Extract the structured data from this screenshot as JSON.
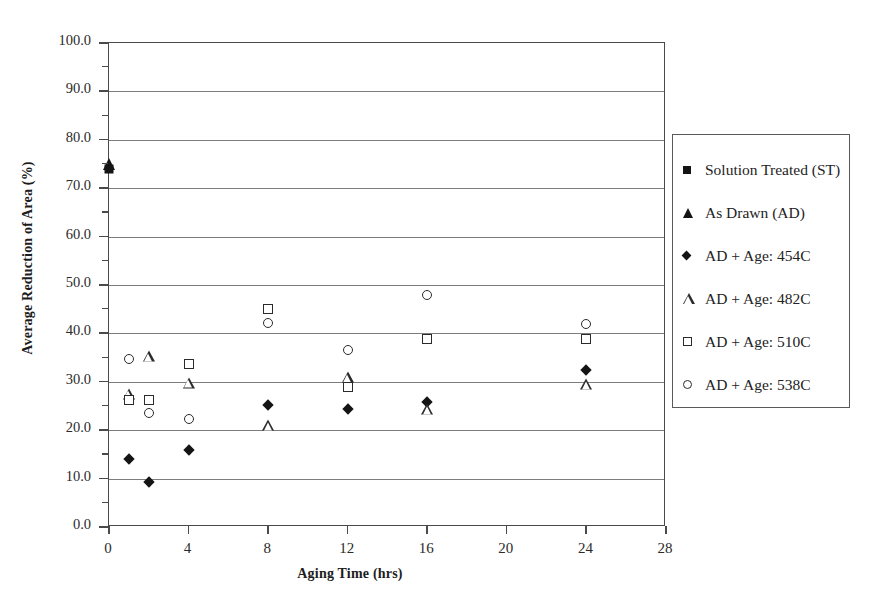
{
  "chart_data": {
    "type": "scatter",
    "title": "",
    "xlabel": "Aging Time (hrs)",
    "ylabel": "Average Reduction of Area (%)",
    "xlim": [
      0,
      28
    ],
    "ylim": [
      0,
      100
    ],
    "xticks": [
      0,
      4,
      8,
      12,
      16,
      20,
      24,
      28
    ],
    "xtick_labels": [
      "0",
      "4",
      "8",
      "12",
      "16",
      "20",
      "24",
      "28"
    ],
    "yticks": [
      0,
      10,
      20,
      30,
      40,
      50,
      60,
      70,
      80,
      90,
      100
    ],
    "ytick_labels": [
      "0.0",
      "10.0",
      "20.0",
      "30.0",
      "40.0",
      "50.0",
      "60.0",
      "70.0",
      "80.0",
      "90.0",
      "100.0"
    ],
    "y_minor_ticks": [
      5,
      15,
      25,
      35,
      45,
      55,
      65,
      75,
      85,
      95
    ],
    "grid": "horizontal",
    "legend_position": "right-outside",
    "series": [
      {
        "name": "Solution Treated (ST)",
        "marker": "filled-square",
        "points": [
          {
            "x": 0,
            "y": 74.0
          }
        ]
      },
      {
        "name": "As Drawn (AD)",
        "marker": "filled-triangle",
        "points": [
          {
            "x": 0,
            "y": 75.0
          }
        ]
      },
      {
        "name": "AD + Age: 454C",
        "marker": "filled-diamond",
        "points": [
          {
            "x": 1,
            "y": 14.0
          },
          {
            "x": 2,
            "y": 9.2
          },
          {
            "x": 4,
            "y": 16.0
          },
          {
            "x": 8,
            "y": 25.3
          },
          {
            "x": 12,
            "y": 24.3
          },
          {
            "x": 16,
            "y": 25.8
          },
          {
            "x": 24,
            "y": 32.5
          }
        ]
      },
      {
        "name": "AD + Age: 482C",
        "marker": "open-triangle",
        "points": [
          {
            "x": 1,
            "y": 27.5
          },
          {
            "x": 2,
            "y": 35.3
          },
          {
            "x": 4,
            "y": 29.8
          },
          {
            "x": 8,
            "y": 21.0
          },
          {
            "x": 12,
            "y": 31.0
          },
          {
            "x": 16,
            "y": 24.3
          },
          {
            "x": 24,
            "y": 29.5
          }
        ]
      },
      {
        "name": "AD + Age: 510C",
        "marker": "open-square",
        "points": [
          {
            "x": 1,
            "y": 26.3
          },
          {
            "x": 2,
            "y": 26.2
          },
          {
            "x": 4,
            "y": 33.7
          },
          {
            "x": 8,
            "y": 45.0
          },
          {
            "x": 12,
            "y": 29.0
          },
          {
            "x": 16,
            "y": 38.8
          },
          {
            "x": 24,
            "y": 38.8
          }
        ]
      },
      {
        "name": "AD + Age: 538C",
        "marker": "open-circle",
        "points": [
          {
            "x": 1,
            "y": 34.7
          },
          {
            "x": 2,
            "y": 23.5
          },
          {
            "x": 4,
            "y": 22.3
          },
          {
            "x": 8,
            "y": 42.2
          },
          {
            "x": 12,
            "y": 36.5
          },
          {
            "x": 16,
            "y": 48.0
          },
          {
            "x": 24,
            "y": 42.0
          }
        ]
      }
    ]
  },
  "legend": {
    "items": [
      {
        "label": "Solution Treated (ST)",
        "marker": "filled-square"
      },
      {
        "label": "As Drawn (AD)",
        "marker": "filled-triangle"
      },
      {
        "label": "AD + Age: 454C",
        "marker": "filled-diamond"
      },
      {
        "label": "AD + Age: 482C",
        "marker": "open-triangle"
      },
      {
        "label": "AD + Age: 510C",
        "marker": "open-square"
      },
      {
        "label": "AD + Age: 538C",
        "marker": "open-circle"
      }
    ]
  }
}
